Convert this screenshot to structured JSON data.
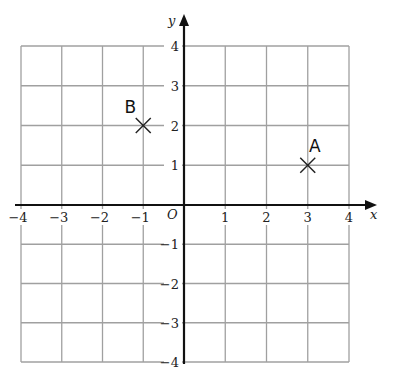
{
  "chart_data": {
    "type": "scatter",
    "title": "",
    "xlabel": "x",
    "ylabel": "y",
    "origin_label": "O",
    "xlim": [
      -4,
      4
    ],
    "ylim": [
      -4,
      4
    ],
    "grid": true,
    "x_ticks": [
      "−4",
      "−3",
      "−2",
      "−1",
      "1",
      "2",
      "3",
      "4"
    ],
    "y_ticks": [
      "4",
      "3",
      "2",
      "1",
      "−1",
      "−2",
      "−3",
      "−4"
    ],
    "points": [
      {
        "label": "A",
        "x": 3,
        "y": 1,
        "marker": "x"
      },
      {
        "label": "B",
        "x": -1,
        "y": 2,
        "marker": "x"
      }
    ],
    "colors": {
      "grid": "#a0a0a0",
      "axis": "#111111",
      "marker": "#222222"
    }
  },
  "corner_mark": ""
}
